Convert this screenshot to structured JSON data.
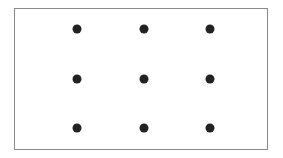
{
  "diagram": {
    "type": "nine-dot-grid",
    "rows": 3,
    "cols": 3,
    "dot_color": "#222222",
    "border_color": "#8a8a8a",
    "dots": [
      {
        "x": 77,
        "y": 29
      },
      {
        "x": 144,
        "y": 29
      },
      {
        "x": 210,
        "y": 29
      },
      {
        "x": 77,
        "y": 79
      },
      {
        "x": 144,
        "y": 79
      },
      {
        "x": 210,
        "y": 79
      },
      {
        "x": 77,
        "y": 128
      },
      {
        "x": 144,
        "y": 128
      },
      {
        "x": 210,
        "y": 128
      }
    ]
  }
}
